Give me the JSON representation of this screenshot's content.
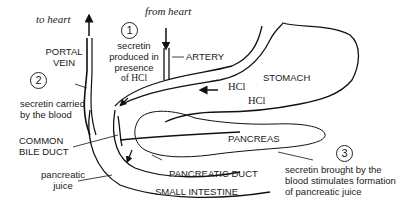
{
  "diagram": {
    "steps": [
      {
        "number": "1",
        "text_lines": [
          "secretin",
          "produced in",
          "presence",
          "of HCl"
        ]
      },
      {
        "number": "2",
        "text_lines": [
          "secretin carried",
          "by the blood"
        ]
      },
      {
        "number": "3",
        "text_lines": [
          "secretin brought by the",
          "blood stimulates formation",
          "of pancreatic juice"
        ]
      }
    ],
    "labels": {
      "to_heart": "to heart",
      "from_heart": "from heart",
      "portal_vein": [
        "PORTAL",
        "VEIN"
      ],
      "artery": "ARTERY",
      "stomach": "STOMACH",
      "hcl_1": "HCl",
      "hcl_2": "HCl",
      "common_bile_duct": [
        "COMMON",
        "BILE DUCT"
      ],
      "pancreatic_juice": [
        "pancreatic",
        "juice"
      ],
      "pancreas": "PANCREAS",
      "pancreatic_duct": "PANCREATIC DUCT",
      "small_intestine": "SMALL INTESTINE"
    }
  }
}
